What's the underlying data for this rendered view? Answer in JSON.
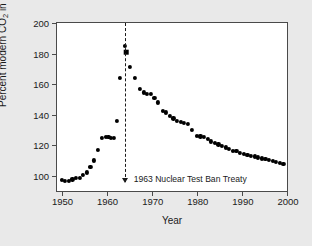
{
  "chart_data": {
    "type": "scatter",
    "title": "",
    "xlabel": "Year",
    "ylabel": "Percent modern CO2 in atmosphere",
    "ylabel_parts": {
      "pre": "Percent modern CO",
      "sub": "2",
      "post": " in atmosphere"
    },
    "xlim": [
      1949,
      2000
    ],
    "ylim": [
      90,
      200
    ],
    "xticks": [
      1950,
      1960,
      1970,
      1980,
      1990,
      2000
    ],
    "yticks": [
      100,
      120,
      140,
      160,
      180,
      200
    ],
    "grid": false,
    "legend": null,
    "marker_color": "#000000",
    "series": [
      {
        "name": "Atmospheric radiocarbon (percent modern)",
        "marker": "circle",
        "points": [
          {
            "x": 1950.0,
            "y": 97.0
          },
          {
            "x": 1950.8,
            "y": 96.5
          },
          {
            "x": 1951.6,
            "y": 96.6
          },
          {
            "x": 1952.4,
            "y": 97.6
          },
          {
            "x": 1953.2,
            "y": 98.4
          },
          {
            "x": 1954.0,
            "y": 98.5
          },
          {
            "x": 1954.8,
            "y": 100.8
          },
          {
            "x": 1955.6,
            "y": 102.2
          },
          {
            "x": 1956.4,
            "y": 106.0
          },
          {
            "x": 1957.2,
            "y": 110.0
          },
          {
            "x": 1958.0,
            "y": 117.0
          },
          {
            "x": 1959.0,
            "y": 124.5
          },
          {
            "x": 1959.8,
            "y": 125.3
          },
          {
            "x": 1960.4,
            "y": 125.2
          },
          {
            "x": 1961.0,
            "y": 125.0
          },
          {
            "x": 1961.6,
            "y": 124.6
          },
          {
            "x": 1962.2,
            "y": 136.0
          },
          {
            "x": 1963.0,
            "y": 164.0
          },
          {
            "x": 1964.0,
            "y": 185.0
          },
          {
            "x": 1965.2,
            "y": 171.0
          },
          {
            "x": 1966.2,
            "y": 164.0
          },
          {
            "x": 1967.4,
            "y": 157.0
          },
          {
            "x": 1968.2,
            "y": 154.5
          },
          {
            "x": 1969.0,
            "y": 153.5
          },
          {
            "x": 1969.8,
            "y": 153.5
          },
          {
            "x": 1970.6,
            "y": 151.0
          },
          {
            "x": 1971.4,
            "y": 148.0
          },
          {
            "x": 1972.4,
            "y": 142.5
          },
          {
            "x": 1973.2,
            "y": 141.5
          },
          {
            "x": 1974.0,
            "y": 139.0
          },
          {
            "x": 1974.8,
            "y": 137.5
          },
          {
            "x": 1975.6,
            "y": 136.0
          },
          {
            "x": 1976.4,
            "y": 135.0
          },
          {
            "x": 1977.2,
            "y": 134.5
          },
          {
            "x": 1978.0,
            "y": 134.0
          },
          {
            "x": 1979.0,
            "y": 130.0
          },
          {
            "x": 1980.0,
            "y": 126.0
          },
          {
            "x": 1980.8,
            "y": 125.8
          },
          {
            "x": 1981.6,
            "y": 125.2
          },
          {
            "x": 1982.4,
            "y": 124.0
          },
          {
            "x": 1983.2,
            "y": 122.5
          },
          {
            "x": 1984.0,
            "y": 121.5
          },
          {
            "x": 1984.8,
            "y": 120.5
          },
          {
            "x": 1985.6,
            "y": 119.5
          },
          {
            "x": 1986.4,
            "y": 118.5
          },
          {
            "x": 1987.2,
            "y": 117.5
          },
          {
            "x": 1988.0,
            "y": 116.5
          },
          {
            "x": 1988.8,
            "y": 116.0
          },
          {
            "x": 1989.6,
            "y": 115.0
          },
          {
            "x": 1990.4,
            "y": 114.5
          },
          {
            "x": 1991.2,
            "y": 113.8
          },
          {
            "x": 1992.0,
            "y": 113.2
          },
          {
            "x": 1992.8,
            "y": 112.6
          },
          {
            "x": 1993.6,
            "y": 112.0
          },
          {
            "x": 1994.4,
            "y": 111.4
          },
          {
            "x": 1995.2,
            "y": 110.8
          },
          {
            "x": 1996.0,
            "y": 110.2
          },
          {
            "x": 1996.8,
            "y": 109.6
          },
          {
            "x": 1997.6,
            "y": 109.0
          },
          {
            "x": 1998.4,
            "y": 108.4
          },
          {
            "x": 1999.2,
            "y": 108.0
          }
        ]
      },
      {
        "name": "Peak value",
        "marker": "square",
        "points": [
          {
            "x": 1964.4,
            "y": 181.0
          }
        ]
      }
    ],
    "annotations": [
      {
        "name": "nuclear-test-ban-treaty",
        "text": "1963 Nuclear Test Ban Treaty",
        "x": 1964.0,
        "y_top": 200,
        "y_bottom": 96,
        "style": "dashed-vline-with-down-arrow"
      }
    ]
  }
}
